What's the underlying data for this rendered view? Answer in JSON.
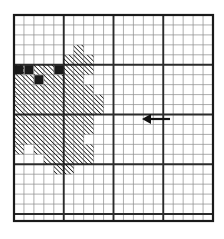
{
  "figure": {
    "type": "graph-paper-diagram",
    "background_color": "#ffffff",
    "ink_color": "#1a1a1a",
    "grid": {
      "left": 14,
      "top": 15,
      "right": 213,
      "bottom": 221,
      "cell_size": 9.95,
      "cols": 20,
      "rows": 21,
      "major_every": 5,
      "minor_line_color": "#8a8a8a",
      "major_line_color": "#2b2b2b",
      "border_color": "#1a1a1a",
      "minor_line_width": 0.7,
      "major_line_width": 1.9,
      "border_line_width": 2.2
    },
    "hatch": {
      "style": "diagonal-45-up",
      "color": "#111111",
      "spacing": 3.2,
      "stroke_width": 1.5
    },
    "solid_cells": [
      {
        "col": 0,
        "row": 5
      },
      {
        "col": 1,
        "row": 5
      },
      {
        "col": 4,
        "row": 5
      },
      {
        "col": 2,
        "row": 6
      }
    ],
    "hatched_cells": [
      {
        "col": 6,
        "row": 3
      },
      {
        "col": 5,
        "row": 4
      },
      {
        "col": 6,
        "row": 4
      },
      {
        "col": 7,
        "row": 4
      },
      {
        "col": 0,
        "row": 5
      },
      {
        "col": 2,
        "row": 5
      },
      {
        "col": 3,
        "row": 5
      },
      {
        "col": 5,
        "row": 5
      },
      {
        "col": 6,
        "row": 5
      },
      {
        "col": 7,
        "row": 5
      },
      {
        "col": 0,
        "row": 6
      },
      {
        "col": 1,
        "row": 6
      },
      {
        "col": 3,
        "row": 6
      },
      {
        "col": 4,
        "row": 6
      },
      {
        "col": 5,
        "row": 6
      },
      {
        "col": 6,
        "row": 6
      },
      {
        "col": 0,
        "row": 7
      },
      {
        "col": 1,
        "row": 7
      },
      {
        "col": 2,
        "row": 7
      },
      {
        "col": 3,
        "row": 7
      },
      {
        "col": 4,
        "row": 7
      },
      {
        "col": 5,
        "row": 7
      },
      {
        "col": 6,
        "row": 7
      },
      {
        "col": 7,
        "row": 7
      },
      {
        "col": 0,
        "row": 8
      },
      {
        "col": 1,
        "row": 8
      },
      {
        "col": 2,
        "row": 8
      },
      {
        "col": 3,
        "row": 8
      },
      {
        "col": 4,
        "row": 8
      },
      {
        "col": 5,
        "row": 8
      },
      {
        "col": 6,
        "row": 8
      },
      {
        "col": 7,
        "row": 8
      },
      {
        "col": 8,
        "row": 8
      },
      {
        "col": 0,
        "row": 9
      },
      {
        "col": 1,
        "row": 9
      },
      {
        "col": 2,
        "row": 9
      },
      {
        "col": 3,
        "row": 9
      },
      {
        "col": 4,
        "row": 9
      },
      {
        "col": 5,
        "row": 9
      },
      {
        "col": 6,
        "row": 9
      },
      {
        "col": 7,
        "row": 9
      },
      {
        "col": 8,
        "row": 9
      },
      {
        "col": 0,
        "row": 10
      },
      {
        "col": 1,
        "row": 10
      },
      {
        "col": 2,
        "row": 10
      },
      {
        "col": 3,
        "row": 10
      },
      {
        "col": 4,
        "row": 10
      },
      {
        "col": 5,
        "row": 10
      },
      {
        "col": 6,
        "row": 10
      },
      {
        "col": 7,
        "row": 10
      },
      {
        "col": 0,
        "row": 11
      },
      {
        "col": 1,
        "row": 11
      },
      {
        "col": 2,
        "row": 11
      },
      {
        "col": 3,
        "row": 11
      },
      {
        "col": 4,
        "row": 11
      },
      {
        "col": 5,
        "row": 11
      },
      {
        "col": 6,
        "row": 11
      },
      {
        "col": 7,
        "row": 11
      },
      {
        "col": 0,
        "row": 12
      },
      {
        "col": 1,
        "row": 12
      },
      {
        "col": 2,
        "row": 12
      },
      {
        "col": 3,
        "row": 12
      },
      {
        "col": 4,
        "row": 12
      },
      {
        "col": 5,
        "row": 12
      },
      {
        "col": 6,
        "row": 12
      },
      {
        "col": 0,
        "row": 13
      },
      {
        "col": 2,
        "row": 13
      },
      {
        "col": 3,
        "row": 13
      },
      {
        "col": 4,
        "row": 13
      },
      {
        "col": 5,
        "row": 13
      },
      {
        "col": 6,
        "row": 13
      },
      {
        "col": 7,
        "row": 13
      },
      {
        "col": 3,
        "row": 14
      },
      {
        "col": 4,
        "row": 14
      },
      {
        "col": 5,
        "row": 14
      },
      {
        "col": 6,
        "row": 14
      },
      {
        "col": 7,
        "row": 14
      },
      {
        "col": 4,
        "row": 15
      },
      {
        "col": 5,
        "row": 15
      }
    ],
    "arrow": {
      "label": "left-pointing-arrow",
      "direction": "left",
      "tip_x": 142,
      "tail_x": 170,
      "y": 119,
      "head_length": 9,
      "head_half_height": 5,
      "shaft_width": 2.2,
      "color": "#111111"
    }
  }
}
